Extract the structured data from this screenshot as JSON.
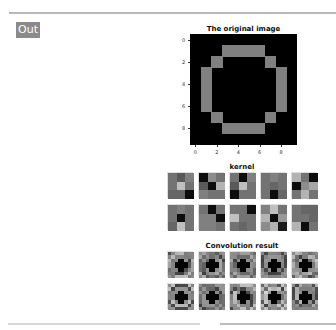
{
  "output_prompt": "Out",
  "figures": {
    "original": {
      "title": "The original image",
      "yticks": [
        "0",
        "2",
        "4",
        "6",
        "8"
      ],
      "xticks": [
        "0",
        "2",
        "4",
        "6",
        "8"
      ],
      "grid": [
        [
          0,
          0,
          0,
          0,
          0,
          0,
          0,
          0,
          0,
          0
        ],
        [
          0,
          0,
          0,
          1,
          1,
          1,
          1,
          0,
          0,
          0
        ],
        [
          0,
          0,
          1,
          0,
          0,
          0,
          0,
          1,
          0,
          0
        ],
        [
          0,
          1,
          0,
          0,
          0,
          0,
          0,
          0,
          1,
          0
        ],
        [
          0,
          1,
          0,
          0,
          0,
          0,
          0,
          0,
          1,
          0
        ],
        [
          0,
          1,
          0,
          0,
          0,
          0,
          0,
          0,
          1,
          0
        ],
        [
          0,
          1,
          0,
          0,
          0,
          0,
          0,
          0,
          1,
          0
        ],
        [
          0,
          0,
          1,
          0,
          0,
          0,
          0,
          1,
          0,
          0
        ],
        [
          0,
          0,
          0,
          1,
          1,
          1,
          1,
          0,
          0,
          0
        ],
        [
          0,
          0,
          0,
          0,
          0,
          0,
          0,
          0,
          0,
          0
        ]
      ],
      "colors": {
        "on": "#808080",
        "off": "#000000"
      }
    },
    "kernels": {
      "title": "kernel",
      "items": [
        [
          [
            0.45,
            0.35,
            0.5
          ],
          [
            0.45,
            0.75,
            0.45
          ],
          [
            0.4,
            0.4,
            0.05
          ]
        ],
        [
          [
            0.05,
            0.55,
            0.45
          ],
          [
            0.35,
            0.05,
            0.7
          ],
          [
            0.5,
            0.45,
            0.45
          ]
        ],
        [
          [
            0.45,
            0.05,
            0.5
          ],
          [
            0.35,
            0.75,
            0.45
          ],
          [
            0.05,
            0.45,
            0.45
          ]
        ],
        [
          [
            0.45,
            0.5,
            0.45
          ],
          [
            0.45,
            0.4,
            0.45
          ],
          [
            0.45,
            0.05,
            0.4
          ]
        ],
        [
          [
            0.7,
            0.45,
            0.05
          ],
          [
            0.05,
            0.55,
            0.65
          ],
          [
            0.45,
            0.7,
            0.45
          ]
        ],
        [
          [
            0.45,
            0.5,
            0.45
          ],
          [
            0.45,
            0.05,
            0.45
          ],
          [
            0.4,
            0.75,
            0.45
          ]
        ],
        [
          [
            0.45,
            0.05,
            0.45
          ],
          [
            0.5,
            0.5,
            0.05
          ],
          [
            0.5,
            0.5,
            0.45
          ]
        ],
        [
          [
            0.45,
            0.45,
            0.05
          ],
          [
            0.75,
            0.45,
            0.45
          ],
          [
            0.45,
            0.4,
            0.45
          ]
        ],
        [
          [
            0.5,
            0.75,
            0.45
          ],
          [
            0.7,
            0.05,
            0.6
          ],
          [
            0.55,
            0.7,
            0.1
          ]
        ],
        [
          [
            0.45,
            0.4,
            0.4
          ],
          [
            0.45,
            0.45,
            0.4
          ],
          [
            0.7,
            0.05,
            0.45
          ]
        ]
      ]
    },
    "convolution": {
      "title": "Convolution result"
    }
  }
}
